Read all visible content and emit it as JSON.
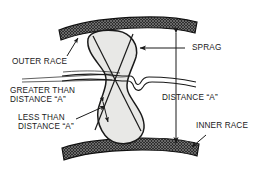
{
  "diagram": {
    "type": "technical-line-drawing",
    "background_color": "#ffffff",
    "line_color": "#1a1a1a",
    "race_fill_color": "#3a3a3a",
    "sprag_fill_color": "#e8e8e6"
  },
  "labels": {
    "outer_race": "OUTER RACE",
    "greater_than_line1": "GREATER THAN",
    "greater_than_line2": "DISTANCE “A”",
    "less_than_line1": "LESS THAN",
    "less_than_line2": "DISTANCE “A”",
    "sprag": "SPRAG",
    "distance_a": "DISTANCE “A”",
    "inner_race": "INNER RACE"
  },
  "components": {
    "outer_race": "curved crosshatched band across top",
    "inner_race": "curved crosshatched band across bottom",
    "sprag": "hourglass shaped cam element with crossing diagonals",
    "cage": "thin horizontal cage strip with notch at right",
    "dimension_line": "vertical double headed arrow labeled DISTANCE A"
  }
}
